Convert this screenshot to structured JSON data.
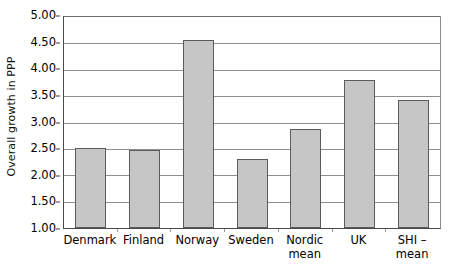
{
  "chart_data": {
    "type": "bar",
    "title": "",
    "xlabel": "",
    "ylabel": "Overall growth in PPP",
    "categories": [
      "Denmark",
      "Finland",
      "Norway",
      "Sweden",
      "Nordic\nmean",
      "UK",
      "SHI –\nmean"
    ],
    "values": [
      2.51,
      2.47,
      4.56,
      2.3,
      2.88,
      3.8,
      3.42
    ],
    "ylim": [
      1.0,
      5.0
    ],
    "ytick_values": [
      5.0,
      4.5,
      4.0,
      3.5,
      3.0,
      2.5,
      2.0,
      1.5,
      1.0
    ],
    "ytick_labels": [
      "5.00",
      "4.50",
      "4.00",
      "3.50",
      "3.00",
      "2.50",
      "2.00",
      "1.50",
      "1.00"
    ],
    "grid": true,
    "grid_axis": "y",
    "legend": false,
    "legend_position": "none",
    "bar_fill_color": "#c6c6c6",
    "bar_border_color": "#5b5b5b",
    "gridline_color": "#8f8f8f",
    "axis_color": "#4a4a4a",
    "background_color": "#ffffff"
  }
}
